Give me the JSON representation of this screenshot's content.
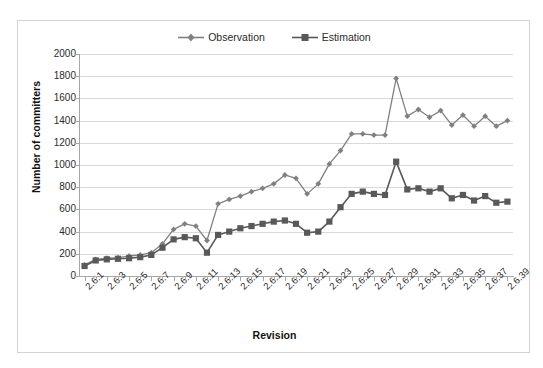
{
  "top_caption": "",
  "chart": {
    "legend": [
      {
        "name": "Observation",
        "marker": "diamond",
        "color": "#808080"
      },
      {
        "name": "Estimation",
        "marker": "square",
        "color": "#595959"
      }
    ],
    "y_axis": {
      "title": "Number of committers",
      "ticks": [
        0,
        200,
        400,
        600,
        800,
        1000,
        1200,
        1400,
        1600,
        1800,
        2000
      ],
      "min": 0,
      "max": 2000
    },
    "x_axis": {
      "title": "Revision",
      "tick_labels": [
        "2.6.1",
        "2.6.3",
        "2.6.5",
        "2.6.7",
        "2.6.9",
        "2.6.11",
        "2.6.13",
        "2.6.15",
        "2.6.17",
        "2.6.19",
        "2.6.21",
        "2.6.23",
        "2.6.25",
        "2.6.27",
        "2.6.29",
        "2.6.31",
        "2.6.33",
        "2.6.35",
        "2.6.37",
        "2.6.39"
      ]
    }
  },
  "chart_data": {
    "type": "line",
    "title": "",
    "xlabel": "Revision",
    "ylabel": "Number of committers",
    "ylim": [
      0,
      2000
    ],
    "grid": true,
    "legend_position": "top-center",
    "x": [
      "2.6.1",
      "2.6.2",
      "2.6.3",
      "2.6.4",
      "2.6.5",
      "2.6.6",
      "2.6.7",
      "2.6.8",
      "2.6.9",
      "2.6.10",
      "2.6.11",
      "2.6.12",
      "2.6.13",
      "2.6.14",
      "2.6.15",
      "2.6.16",
      "2.6.17",
      "2.6.18",
      "2.6.19",
      "2.6.20",
      "2.6.21",
      "2.6.22",
      "2.6.23",
      "2.6.24",
      "2.6.25",
      "2.6.26",
      "2.6.27",
      "2.6.28",
      "2.6.29",
      "2.6.30",
      "2.6.31",
      "2.6.32",
      "2.6.33",
      "2.6.34",
      "2.6.35",
      "2.6.36",
      "2.6.37",
      "2.6.38",
      "2.6.39"
    ],
    "series": [
      {
        "name": "Observation",
        "color": "#808080",
        "marker": "diamond",
        "values": [
          100,
          150,
          160,
          165,
          180,
          190,
          210,
          290,
          420,
          470,
          450,
          320,
          650,
          690,
          720,
          760,
          790,
          830,
          910,
          880,
          740,
          830,
          1010,
          1130,
          1280,
          1280,
          1270,
          1270,
          1780,
          1440,
          1500,
          1430,
          1490,
          1360,
          1450,
          1350,
          1440,
          1350,
          1400
        ]
      },
      {
        "name": "Estimation",
        "color": "#595959",
        "marker": "square",
        "values": [
          90,
          140,
          150,
          155,
          160,
          170,
          190,
          255,
          330,
          350,
          340,
          210,
          370,
          400,
          430,
          450,
          470,
          490,
          500,
          470,
          390,
          400,
          490,
          620,
          740,
          760,
          740,
          730,
          1030,
          780,
          790,
          760,
          790,
          700,
          730,
          680,
          720,
          660,
          670
        ]
      }
    ]
  }
}
